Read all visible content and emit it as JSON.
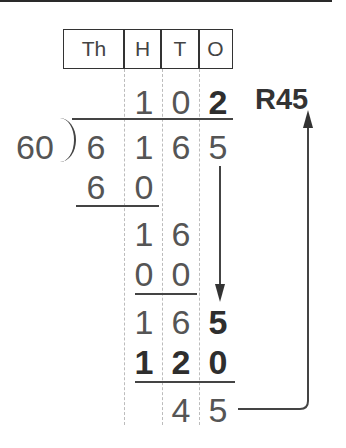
{
  "header": {
    "place_values": [
      "Th",
      "H",
      "T",
      "O"
    ]
  },
  "quotient": {
    "digits": [
      "1",
      "0",
      "2"
    ],
    "remainder_label": "R45"
  },
  "divisor": "60",
  "dividend": {
    "digits": [
      "6",
      "1",
      "6",
      "5"
    ]
  },
  "steps": [
    {
      "row": "subtract",
      "digits": [
        "6",
        "0"
      ]
    },
    {
      "row": "difference",
      "digits": [
        "1",
        "6"
      ]
    },
    {
      "row": "subtract",
      "digits": [
        "0",
        "0"
      ]
    },
    {
      "row": "bring_down",
      "digits": [
        "1",
        "6",
        "5"
      ]
    },
    {
      "row": "subtract",
      "digits": [
        "1",
        "2",
        "0"
      ]
    },
    {
      "row": "remainder",
      "digits": [
        "4",
        "5"
      ]
    }
  ],
  "colors": {
    "ink": "#3a3a3a",
    "guide": "#bcbcbc"
  }
}
